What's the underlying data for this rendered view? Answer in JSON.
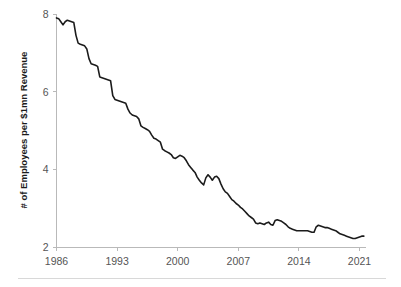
{
  "chart_data": {
    "type": "line",
    "title": "",
    "subtitle": "",
    "xlabel": "",
    "ylabel": "# of Employees per $1mn Revenue",
    "xlim": [
      1986,
      2021.75
    ],
    "ylim": [
      2,
      8
    ],
    "xticks": [
      1986,
      1993,
      2000,
      2007,
      2014,
      2021
    ],
    "xtick_labels": [
      "1986",
      "1993",
      "2000",
      "2007",
      "2014",
      "2021"
    ],
    "yticks": [
      2,
      4,
      6,
      8
    ],
    "ytick_labels": [
      "2",
      "4",
      "6",
      "8"
    ],
    "grid": false,
    "legend": false,
    "legend_position": "none",
    "line_color": "#1b1b1b",
    "axis_color": "#b9b9b9",
    "background_color": "#ffffff",
    "series": [
      {
        "name": "# of Employees per $1mn Revenue",
        "x": [
          1986.0,
          1986.25,
          1986.5,
          1986.75,
          1987.0,
          1987.25,
          1987.5,
          1987.75,
          1988.0,
          1988.25,
          1988.5,
          1988.75,
          1989.0,
          1989.25,
          1989.5,
          1989.75,
          1990.0,
          1990.25,
          1990.5,
          1990.75,
          1991.0,
          1991.25,
          1991.5,
          1991.75,
          1992.0,
          1992.25,
          1992.5,
          1992.75,
          1993.0,
          1993.25,
          1993.5,
          1993.75,
          1994.0,
          1994.25,
          1994.5,
          1994.75,
          1995.0,
          1995.25,
          1995.5,
          1995.75,
          1996.0,
          1996.25,
          1996.5,
          1996.75,
          1997.0,
          1997.25,
          1997.5,
          1997.75,
          1998.0,
          1998.25,
          1998.5,
          1998.75,
          1999.0,
          1999.25,
          1999.5,
          1999.75,
          2000.0,
          2000.25,
          2000.5,
          2000.75,
          2001.0,
          2001.25,
          2001.5,
          2001.75,
          2002.0,
          2002.25,
          2002.5,
          2002.75,
          2003.0,
          2003.25,
          2003.5,
          2003.75,
          2004.0,
          2004.25,
          2004.5,
          2004.75,
          2005.0,
          2005.25,
          2005.5,
          2005.75,
          2006.0,
          2006.25,
          2006.5,
          2006.75,
          2007.0,
          2007.25,
          2007.5,
          2007.75,
          2008.0,
          2008.25,
          2008.5,
          2008.75,
          2009.0,
          2009.25,
          2009.5,
          2009.75,
          2010.0,
          2010.25,
          2010.5,
          2010.75,
          2011.0,
          2011.25,
          2011.5,
          2011.75,
          2012.0,
          2012.25,
          2012.5,
          2012.75,
          2013.0,
          2013.25,
          2013.5,
          2013.75,
          2014.0,
          2014.25,
          2014.5,
          2014.75,
          2015.0,
          2015.25,
          2015.5,
          2015.75,
          2016.0,
          2016.25,
          2016.5,
          2016.75,
          2017.0,
          2017.25,
          2017.5,
          2017.75,
          2018.0,
          2018.25,
          2018.5,
          2018.75,
          2019.0,
          2019.25,
          2019.5,
          2019.75,
          2020.0,
          2020.25,
          2020.5,
          2020.75,
          2021.0,
          2021.25,
          2021.5
        ],
        "values": [
          7.9,
          7.88,
          7.8,
          7.72,
          7.8,
          7.84,
          7.82,
          7.8,
          7.78,
          7.45,
          7.25,
          7.22,
          7.2,
          7.18,
          7.1,
          6.85,
          6.72,
          6.7,
          6.68,
          6.65,
          6.38,
          6.36,
          6.34,
          6.32,
          6.3,
          6.28,
          5.9,
          5.8,
          5.78,
          5.76,
          5.74,
          5.72,
          5.7,
          5.55,
          5.45,
          5.4,
          5.38,
          5.36,
          5.3,
          5.12,
          5.08,
          5.05,
          5.02,
          4.98,
          4.88,
          4.8,
          4.78,
          4.74,
          4.7,
          4.52,
          4.48,
          4.45,
          4.42,
          4.38,
          4.3,
          4.28,
          4.32,
          4.36,
          4.34,
          4.3,
          4.22,
          4.12,
          4.05,
          3.98,
          3.92,
          3.8,
          3.72,
          3.65,
          3.6,
          3.78,
          3.86,
          3.8,
          3.72,
          3.8,
          3.82,
          3.76,
          3.62,
          3.5,
          3.42,
          3.38,
          3.3,
          3.22,
          3.18,
          3.12,
          3.08,
          3.02,
          2.98,
          2.92,
          2.86,
          2.8,
          2.76,
          2.72,
          2.62,
          2.6,
          2.62,
          2.6,
          2.58,
          2.62,
          2.64,
          2.58,
          2.56,
          2.68,
          2.7,
          2.68,
          2.66,
          2.62,
          2.58,
          2.52,
          2.48,
          2.46,
          2.44,
          2.42,
          2.42,
          2.42,
          2.42,
          2.42,
          2.42,
          2.4,
          2.38,
          2.38,
          2.52,
          2.56,
          2.54,
          2.52,
          2.5,
          2.5,
          2.48,
          2.46,
          2.44,
          2.42,
          2.38,
          2.34,
          2.32,
          2.3,
          2.28,
          2.26,
          2.24,
          2.22,
          2.22,
          2.24,
          2.26,
          2.28,
          2.28
        ]
      }
    ]
  },
  "footer": {
    "divider": ""
  }
}
